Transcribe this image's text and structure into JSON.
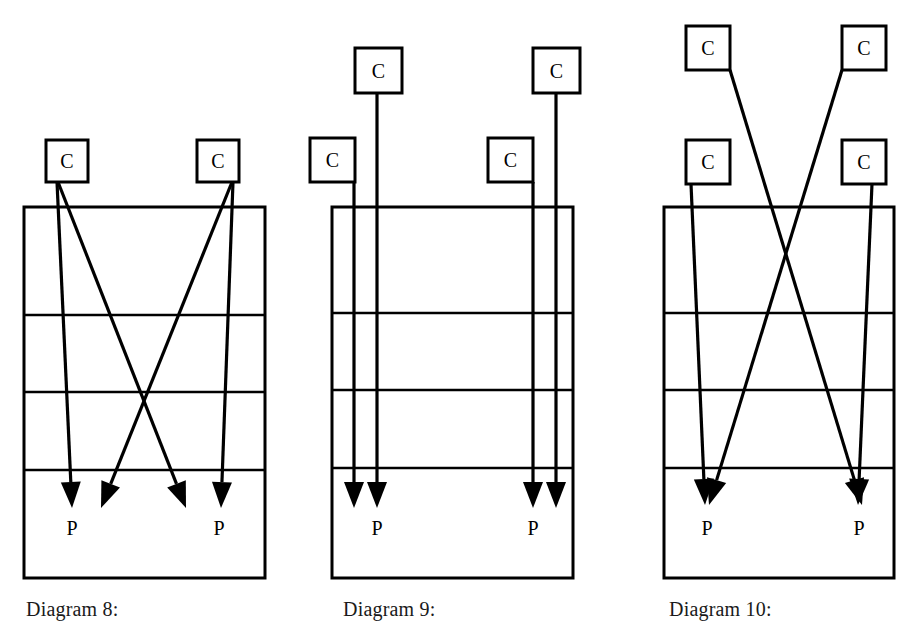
{
  "page": {
    "width": 915,
    "height": 635,
    "background_color": "#ffffff",
    "stroke_color": "#000000",
    "text_color": "#000000"
  },
  "diagrams": [
    {
      "id": "diagram-8",
      "caption": "Diagram 8:",
      "caption_x": 26,
      "caption_y": 598,
      "table": {
        "x": 24,
        "y": 207,
        "width": 241,
        "height": 371,
        "row_divider_y": [
          315,
          392,
          470
        ],
        "rows": 4
      },
      "consumers": [
        {
          "label": "C",
          "x": 46,
          "y": 140,
          "width": 42,
          "height": 42
        },
        {
          "label": "C",
          "x": 197,
          "y": 140,
          "width": 42,
          "height": 42
        }
      ],
      "producers": [
        {
          "label": "P",
          "x": 72,
          "y": 535
        },
        {
          "label": "P",
          "x": 219,
          "y": 535
        }
      ],
      "arrows": [
        {
          "from": "C1",
          "x1": 57,
          "y1": 182,
          "x2": 72,
          "y2": 508,
          "kind": "near-vertical"
        },
        {
          "from": "C1",
          "x1": 58,
          "y1": 182,
          "x2": 186,
          "y2": 508,
          "kind": "diagonal"
        },
        {
          "from": "C2",
          "x1": 233,
          "y1": 182,
          "x2": 221,
          "y2": 508,
          "kind": "near-vertical"
        },
        {
          "from": "C2",
          "x1": 232,
          "y1": 182,
          "x2": 101,
          "y2": 508,
          "kind": "diagonal"
        }
      ]
    },
    {
      "id": "diagram-9",
      "caption": "Diagram 9:",
      "caption_x": 343,
      "caption_y": 598,
      "table": {
        "x": 332,
        "y": 207,
        "width": 241,
        "height": 371,
        "row_divider_y": [
          313,
          390,
          468
        ],
        "rows": 4
      },
      "consumers": [
        {
          "label": "C",
          "x": 355,
          "y": 48,
          "width": 47,
          "height": 45,
          "position": "upper-left"
        },
        {
          "label": "C",
          "x": 310,
          "y": 138,
          "width": 45,
          "height": 44,
          "position": "lower-left"
        },
        {
          "label": "C",
          "x": 533,
          "y": 48,
          "width": 47,
          "height": 45,
          "position": "upper-right"
        },
        {
          "label": "C",
          "x": 488,
          "y": 138,
          "width": 45,
          "height": 44,
          "position": "lower-right"
        }
      ],
      "producers": [
        {
          "label": "P",
          "x": 377,
          "y": 535
        },
        {
          "label": "P",
          "x": 533,
          "y": 535
        }
      ],
      "arrows": [
        {
          "from": "C-upper-left",
          "x1": 377,
          "y1": 93,
          "x2": 377,
          "y2": 508,
          "kind": "vertical"
        },
        {
          "from": "C-lower-left",
          "x1": 354,
          "y1": 182,
          "x2": 354,
          "y2": 508,
          "kind": "vertical"
        },
        {
          "from": "C-upper-right",
          "x1": 556,
          "y1": 93,
          "x2": 556,
          "y2": 508,
          "kind": "vertical"
        },
        {
          "from": "C-lower-right",
          "x1": 533,
          "y1": 182,
          "x2": 533,
          "y2": 508,
          "kind": "vertical"
        }
      ]
    },
    {
      "id": "diagram-10",
      "caption": "Diagram 10:",
      "caption_x": 669,
      "caption_y": 598,
      "table": {
        "x": 664,
        "y": 207,
        "width": 230,
        "height": 371,
        "row_divider_y": [
          313,
          390,
          468
        ],
        "rows": 4
      },
      "consumers": [
        {
          "label": "C",
          "x": 686,
          "y": 26,
          "width": 44,
          "height": 44,
          "position": "upper-left"
        },
        {
          "label": "C",
          "x": 686,
          "y": 140,
          "width": 44,
          "height": 44,
          "position": "lower-left"
        },
        {
          "label": "C",
          "x": 842,
          "y": 26,
          "width": 44,
          "height": 44,
          "position": "upper-right"
        },
        {
          "label": "C",
          "x": 842,
          "y": 140,
          "width": 44,
          "height": 44,
          "position": "lower-right"
        }
      ],
      "producers": [
        {
          "label": "P",
          "x": 707,
          "y": 535
        },
        {
          "label": "P",
          "x": 859,
          "y": 535
        }
      ],
      "arrows": [
        {
          "from": "C-upper-left",
          "x1": 730,
          "y1": 70,
          "x2": 862,
          "y2": 505,
          "kind": "diagonal-cross"
        },
        {
          "from": "C-upper-right",
          "x1": 842,
          "y1": 70,
          "x2": 709,
          "y2": 505,
          "kind": "diagonal-cross"
        },
        {
          "from": "C-lower-left",
          "x1": 691,
          "y1": 184,
          "x2": 705,
          "y2": 505,
          "kind": "near-vertical"
        },
        {
          "from": "C-lower-right",
          "x1": 872,
          "y1": 184,
          "x2": 858,
          "y2": 505,
          "kind": "near-vertical"
        }
      ]
    }
  ],
  "legend": {
    "consumer_symbol": "C",
    "producer_symbol": "P"
  }
}
